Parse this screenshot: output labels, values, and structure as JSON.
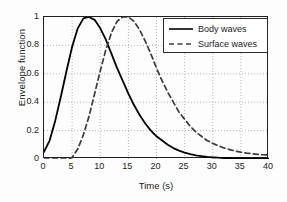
{
  "chart_data": {
    "type": "line",
    "title": "",
    "xlabel": "Time  (s)",
    "ylabel": "Envelope function",
    "xlim": [
      0,
      40
    ],
    "ylim": [
      0,
      1
    ],
    "grid": true,
    "legend_position": "top-right",
    "xticks": [
      "0",
      "5",
      "10",
      "15",
      "20",
      "25",
      "30",
      "35",
      "40"
    ],
    "xtick_values": [
      0,
      5,
      10,
      15,
      20,
      25,
      30,
      35,
      40
    ],
    "yticks": [
      "0",
      "0.2",
      "0.4",
      "0.6",
      "0.8",
      "1"
    ],
    "ytick_values": [
      0,
      0.2,
      0.4,
      0.6,
      0.8,
      1
    ],
    "x": [
      0,
      1,
      2,
      3,
      4,
      5,
      6,
      7,
      8,
      9,
      10,
      11,
      12,
      13,
      14,
      15,
      16,
      17,
      18,
      19,
      20,
      21,
      22,
      23,
      24,
      25,
      26,
      27,
      28,
      29,
      30,
      31,
      32,
      33,
      34,
      35,
      36,
      37,
      38,
      39,
      40
    ],
    "series": [
      {
        "name": "Body waves",
        "style": "solid",
        "color": "#000000",
        "values": [
          0.05,
          0.13,
          0.27,
          0.44,
          0.62,
          0.79,
          0.92,
          0.99,
          1.0,
          0.98,
          0.92,
          0.84,
          0.74,
          0.64,
          0.55,
          0.46,
          0.38,
          0.31,
          0.25,
          0.2,
          0.16,
          0.13,
          0.1,
          0.077,
          0.059,
          0.045,
          0.034,
          0.026,
          0.02,
          0.015,
          0.012,
          0.009,
          0.007,
          0.006,
          0.005,
          0.004,
          0.003,
          0.003,
          0.002,
          0.002,
          0.002
        ]
      },
      {
        "name": "Surface waves",
        "style": "dashed",
        "color": "#3a3a3a",
        "values": [
          0.0,
          0.0,
          0.0,
          0.0,
          0.0,
          0.01,
          0.07,
          0.17,
          0.3,
          0.46,
          0.62,
          0.77,
          0.89,
          0.97,
          1.0,
          1.0,
          0.97,
          0.91,
          0.83,
          0.74,
          0.64,
          0.55,
          0.47,
          0.4,
          0.33,
          0.28,
          0.23,
          0.19,
          0.16,
          0.13,
          0.11,
          0.093,
          0.078,
          0.066,
          0.056,
          0.048,
          0.042,
          0.037,
          0.033,
          0.03,
          0.028
        ]
      }
    ]
  },
  "legend": {
    "items": [
      {
        "label": "Body waves"
      },
      {
        "label": "Surface waves"
      }
    ]
  }
}
